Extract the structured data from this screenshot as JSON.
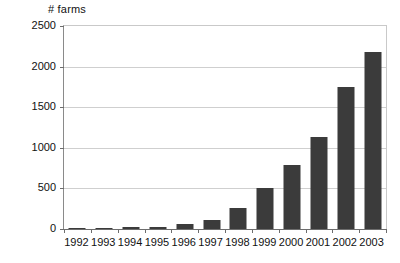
{
  "chart_data": {
    "type": "bar",
    "title": "",
    "subtitle": "",
    "ylabel": "# farms",
    "xlabel": "",
    "categories": [
      "1992",
      "1993",
      "1994",
      "1995",
      "1996",
      "1997",
      "1998",
      "1999",
      "2000",
      "2001",
      "2002",
      "2003"
    ],
    "values": [
      10,
      15,
      20,
      30,
      60,
      110,
      255,
      500,
      790,
      1130,
      1750,
      2180
    ],
    "series": [
      {
        "name": "# farms",
        "values": [
          10,
          15,
          20,
          30,
          60,
          110,
          255,
          500,
          790,
          1130,
          1750,
          2180
        ]
      }
    ],
    "ylim": [
      0,
      2500
    ],
    "ytick_values": [
      0,
      500,
      1000,
      1500,
      2000,
      2500
    ],
    "ytick_labels": [
      "0",
      "500",
      "1000",
      "1500",
      "2000",
      "2500"
    ],
    "grid": true,
    "grid_axis": "y",
    "legend": false,
    "legend_position": "none",
    "bar_color": "#3b3b3b",
    "gridline_color": "#cfcfcf",
    "axis_color": "#6d6d6d",
    "plot_background": "#ffffff",
    "text_color": "#111111",
    "annotations": []
  }
}
